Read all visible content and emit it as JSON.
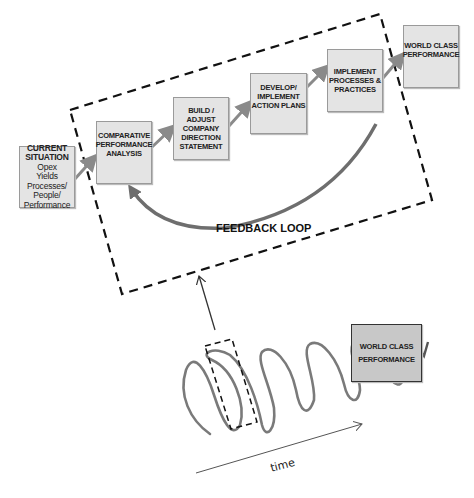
{
  "diagram": {
    "boxes": {
      "current_situation": {
        "line1": "CURRENT",
        "line2": "SITUATION",
        "line3": "Opex",
        "line4": "Yields",
        "line5": "Processes/",
        "line6": "People/",
        "line7": "Performance"
      },
      "comparative": "COMPARATIVE PERFORMANCE ANALYSIS",
      "build_adjust": "BUILD / ADJUST COMPANY DIRECTION STATEMENT",
      "develop": "DEVELOP/ IMPLEMENT ACTION PLANS",
      "implement": "IMPLEMENT PROCESSES & PRACTICES",
      "world_class_top": "WORLD CLASS PERFORMANCE",
      "world_class_bottom": "WORLD CLASS PERFORMANCE"
    },
    "feedback_label": "FEEDBACK LOOP",
    "time_label": "time",
    "colors": {
      "box_fill": "#e4e4e4",
      "arrow_gray": "#8a8a8a",
      "dashed": "#111111",
      "bottom_box_fill": "#c8c8c8"
    }
  }
}
